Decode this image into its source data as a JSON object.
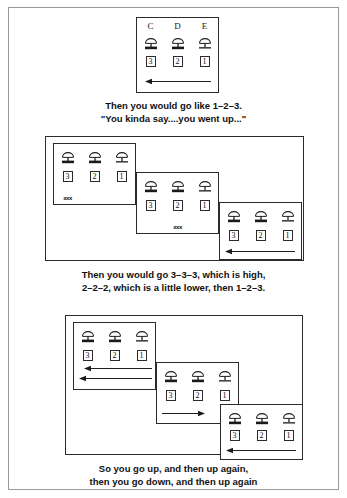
{
  "figure": {
    "line_color": "#2b2b2b",
    "border_color": "#9a9a9a",
    "text_color": "#111111"
  },
  "icons": {
    "lamp": "lamp-icon",
    "arrow_left": "arrow-left-icon",
    "arrow_right": "arrow-right-icon"
  },
  "groups": [
    {
      "id": "group-1",
      "panels": [
        {
          "id": "g1-panel-1",
          "headers": [
            "C",
            "D",
            "E"
          ],
          "lamps": [
            "thick",
            "thick",
            "thin"
          ],
          "numbers": [
            "3",
            "2",
            "1"
          ],
          "marks": [
            "",
            "",
            ""
          ],
          "arrows": [
            "left"
          ]
        }
      ],
      "caption": [
        "Then you would go like 1–2–3.",
        "\"You kinda say....you went up...\""
      ]
    },
    {
      "id": "group-2",
      "panels": [
        {
          "id": "g2-panel-1",
          "headers": [
            "",
            "",
            ""
          ],
          "lamps": [
            "thick",
            "thick",
            "thin"
          ],
          "numbers": [
            "3",
            "2",
            "1"
          ],
          "marks": [
            "xxx",
            "",
            ""
          ],
          "arrows": []
        },
        {
          "id": "g2-panel-2",
          "headers": [
            "",
            "",
            ""
          ],
          "lamps": [
            "thick",
            "thick",
            "thin"
          ],
          "numbers": [
            "3",
            "2",
            "1"
          ],
          "marks": [
            "",
            "xxx",
            ""
          ],
          "arrows": []
        },
        {
          "id": "g2-panel-3",
          "headers": [
            "",
            "",
            ""
          ],
          "lamps": [
            "thick",
            "thick",
            "thin"
          ],
          "numbers": [
            "3",
            "2",
            "1"
          ],
          "marks": [
            "",
            "",
            ""
          ],
          "arrows": [
            "left"
          ]
        }
      ],
      "caption": [
        "Then you would go 3–3–3, which is high,",
        "2–2–2, which is a little lower, then 1–2–3."
      ]
    },
    {
      "id": "group-3",
      "panels": [
        {
          "id": "g3-panel-1",
          "headers": [
            "",
            "",
            ""
          ],
          "lamps": [
            "thick",
            "thick",
            "thin"
          ],
          "numbers": [
            "3",
            "2",
            "1"
          ],
          "marks": [
            "",
            "",
            ""
          ],
          "arrows": [
            "left",
            "left"
          ]
        },
        {
          "id": "g3-panel-2",
          "headers": [
            "",
            "",
            ""
          ],
          "lamps": [
            "thick",
            "thick",
            "thin"
          ],
          "numbers": [
            "3",
            "2",
            "1"
          ],
          "marks": [
            "",
            "",
            ""
          ],
          "arrows": [
            "right"
          ]
        },
        {
          "id": "g3-panel-3",
          "headers": [
            "",
            "",
            ""
          ],
          "lamps": [
            "thick",
            "thick",
            "thin"
          ],
          "numbers": [
            "3",
            "2",
            "1"
          ],
          "marks": [
            "",
            "",
            ""
          ],
          "arrows": [
            "left"
          ]
        }
      ],
      "caption": [
        "So you go up, and then up again,",
        "then you go down, and then up again"
      ]
    }
  ]
}
